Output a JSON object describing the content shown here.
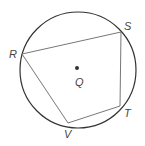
{
  "diagram": {
    "type": "inscribed-quadrilateral-in-circle",
    "circle": {
      "center_label": "Q",
      "cx": 78,
      "cy": 70,
      "r": 58,
      "stroke": "#333333"
    },
    "center_point": {
      "label": "Q",
      "x": 77,
      "y": 68,
      "label_x": 75,
      "label_y": 86
    },
    "vertices": [
      {
        "label": "R",
        "x": 22,
        "y": 54,
        "label_x": 9,
        "label_y": 58
      },
      {
        "label": "S",
        "x": 121,
        "y": 32,
        "label_x": 124,
        "label_y": 30
      },
      {
        "label": "T",
        "x": 120,
        "y": 106,
        "label_x": 124,
        "label_y": 117
      },
      {
        "label": "V",
        "x": 68,
        "y": 123,
        "label_x": 64,
        "label_y": 138
      }
    ],
    "quadrilateral": {
      "name": "RSTV",
      "stroke": "#777777"
    }
  }
}
